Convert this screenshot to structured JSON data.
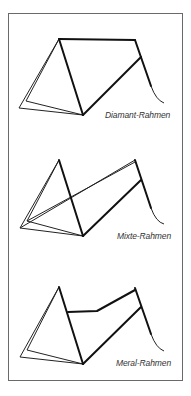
{
  "figure": {
    "frames": [
      {
        "id": "diamant",
        "label": "Diamant-Rahmen"
      },
      {
        "id": "mixte",
        "label": "Mixte-Rahmen"
      },
      {
        "id": "meral",
        "label": "Meral-Rahmen"
      }
    ]
  },
  "colors": {
    "line": "#111111",
    "border": "#6a6a6a",
    "label": "#333333"
  }
}
